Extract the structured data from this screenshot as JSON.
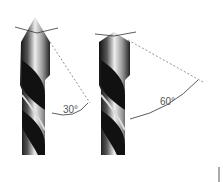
{
  "diagram": {
    "drills": [
      {
        "id": "left",
        "angle_label": "30°"
      },
      {
        "id": "right",
        "angle_label": "60°"
      }
    ]
  }
}
